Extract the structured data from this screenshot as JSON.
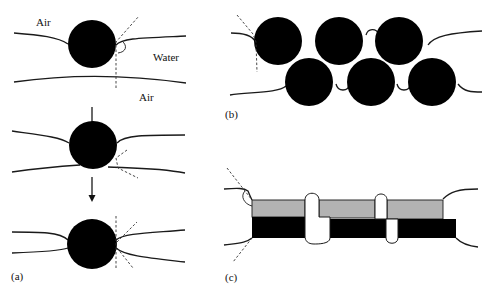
{
  "figure": {
    "panels": [
      {
        "id": "a",
        "label": "(a)",
        "labels": {
          "air_top": "Air",
          "water": "Water",
          "air_bottom": "Air"
        },
        "stages": 3,
        "description": "Single particle at air-water film interface progressing through film thinning"
      },
      {
        "id": "b",
        "label": "(b)",
        "particle_count": 6,
        "description": "Layer of particles bridging a film"
      },
      {
        "id": "c",
        "label": "(c)",
        "description": "Platelet particles (gray and black layers) bridging a film"
      }
    ],
    "colors": {
      "particle": "#000000",
      "platelet_gray": "#b3b3b3",
      "platelet_black": "#000000",
      "line": "#1a1a1a"
    }
  }
}
